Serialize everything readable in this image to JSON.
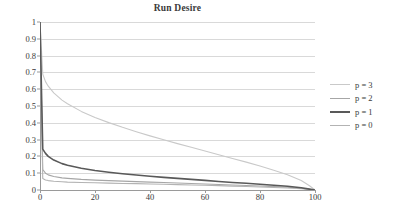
{
  "chart_data": {
    "type": "line",
    "title": "Run Desire",
    "xlabel": "",
    "ylabel": "",
    "xlim": [
      0,
      100
    ],
    "ylim": [
      0,
      1
    ],
    "grid": "horizontal",
    "legend_position": "right",
    "x_ticks": [
      "0",
      "20",
      "40",
      "60",
      "80",
      "100"
    ],
    "x_tick_values": [
      0,
      20,
      40,
      60,
      80,
      100
    ],
    "y_ticks": [
      "0",
      "0.1",
      "0.2",
      "0.3",
      "0.4",
      "0.5",
      "0.6",
      "0.7",
      "0.8",
      "0.9",
      "1"
    ],
    "y_tick_values": [
      0,
      0.1,
      0.2,
      0.3,
      0.4,
      0.5,
      0.6,
      0.7,
      0.8,
      0.9,
      1
    ],
    "series": [
      {
        "name": "p = 3",
        "color": "#c9c9c9",
        "width": 1.1,
        "x": [
          0,
          1,
          2,
          3,
          5,
          8,
          10,
          15,
          20,
          25,
          30,
          35,
          40,
          45,
          50,
          55,
          60,
          65,
          70,
          75,
          80,
          85,
          90,
          95,
          98,
          100
        ],
        "values": [
          1.0,
          0.69,
          0.645,
          0.618,
          0.578,
          0.535,
          0.513,
          0.468,
          0.432,
          0.401,
          0.373,
          0.347,
          0.322,
          0.299,
          0.276,
          0.254,
          0.232,
          0.21,
          0.188,
          0.166,
          0.143,
          0.118,
          0.091,
          0.056,
          0.025,
          0.0
        ]
      },
      {
        "name": "p = 2",
        "color": "#a6a6a6",
        "width": 1.1,
        "x": [
          0,
          1,
          2,
          3,
          5,
          8,
          10,
          15,
          20,
          25,
          30,
          35,
          40,
          45,
          50,
          55,
          60,
          65,
          70,
          75,
          80,
          85,
          90,
          95,
          98,
          100
        ],
        "values": [
          1.0,
          0.122,
          0.1,
          0.09,
          0.08,
          0.072,
          0.069,
          0.063,
          0.059,
          0.056,
          0.053,
          0.05,
          0.047,
          0.045,
          0.042,
          0.039,
          0.036,
          0.033,
          0.03,
          0.027,
          0.024,
          0.02,
          0.016,
          0.01,
          0.004,
          0.0
        ]
      },
      {
        "name": "p = 1",
        "color": "#595959",
        "width": 1.6,
        "x": [
          0,
          1,
          2,
          3,
          5,
          8,
          10,
          15,
          20,
          25,
          30,
          35,
          40,
          45,
          50,
          55,
          60,
          65,
          70,
          75,
          80,
          85,
          90,
          95,
          98,
          100
        ],
        "values": [
          1.0,
          0.243,
          0.218,
          0.2,
          0.178,
          0.157,
          0.147,
          0.129,
          0.116,
          0.106,
          0.097,
          0.089,
          0.082,
          0.075,
          0.069,
          0.063,
          0.057,
          0.051,
          0.045,
          0.04,
          0.034,
          0.028,
          0.022,
          0.013,
          0.005,
          0.0
        ]
      },
      {
        "name": "p = 0",
        "color": "#b3b3b3",
        "width": 1.1,
        "x": [
          0,
          1,
          2,
          3,
          5,
          8,
          10,
          15,
          20,
          25,
          30,
          35,
          40,
          45,
          50,
          55,
          60,
          65,
          70,
          75,
          80,
          85,
          90,
          95,
          98,
          100
        ],
        "values": [
          1.0,
          0.068,
          0.06,
          0.056,
          0.052,
          0.049,
          0.047,
          0.045,
          0.043,
          0.041,
          0.039,
          0.038,
          0.036,
          0.034,
          0.032,
          0.03,
          0.028,
          0.026,
          0.023,
          0.021,
          0.018,
          0.015,
          0.012,
          0.008,
          0.003,
          0.0
        ]
      }
    ]
  },
  "legend": {
    "items": [
      {
        "label": "p = 3"
      },
      {
        "label": "p = 2"
      },
      {
        "label": "p = 1"
      },
      {
        "label": "p = 0"
      }
    ]
  },
  "colors": {
    "gridline": "#d9d9d9",
    "axis": "#9a9a9a",
    "text": "#3a3a3a",
    "background": "#ffffff"
  }
}
